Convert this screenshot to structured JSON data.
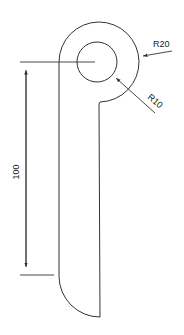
{
  "drawing": {
    "type": "mechanical part drawing",
    "colors": {
      "line": "#333333",
      "background": "#ffffff"
    }
  },
  "dimensions": {
    "outer_radius": "R20",
    "inner_radius": "R10",
    "length": "100"
  }
}
